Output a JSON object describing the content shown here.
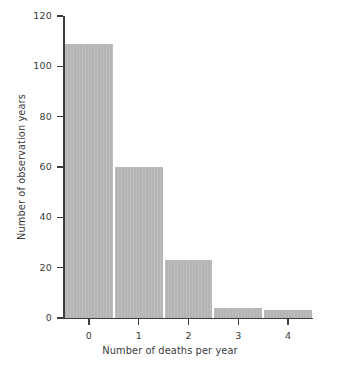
{
  "chart_data": {
    "type": "bar",
    "title": "",
    "subtitle": "",
    "xlabel": "Number of deaths per year",
    "ylabel": "Number of observation years",
    "categories": [
      "0",
      "1",
      "2",
      "3",
      "4"
    ],
    "values": [
      109,
      60,
      23,
      4,
      3
    ],
    "x": [
      0,
      1,
      2,
      3,
      4
    ],
    "xlim": [
      -0.5,
      4.5
    ],
    "ylim": [
      0,
      120
    ],
    "xticks": [
      "0",
      "1",
      "2",
      "3",
      "4"
    ],
    "yticks": [
      "0",
      "20",
      "40",
      "60",
      "80",
      "100",
      "120"
    ],
    "ytick_values": [
      0,
      20,
      40,
      60,
      80,
      100,
      120
    ],
    "grid": false,
    "legend": false,
    "legend_position": "none",
    "bar_color": "#b4b4b4",
    "axis_color": "#3d3d3d",
    "text_color": "#3a3a3a",
    "background": "#ffffff",
    "annotations": []
  }
}
